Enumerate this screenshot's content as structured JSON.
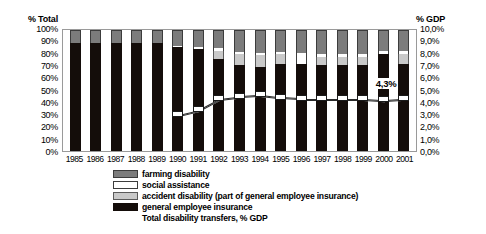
{
  "chart_data": {
    "type": "bar",
    "title": "",
    "subtitle": "",
    "stacked": true,
    "stack_mode": "percent",
    "grid": false,
    "legend_position": "bottom",
    "categories": [
      "1985",
      "1986",
      "1987",
      "1988",
      "1989",
      "1990",
      "1991",
      "1992",
      "1993",
      "1994",
      "1995",
      "1996",
      "1997",
      "1998",
      "1999",
      "2000",
      "2001"
    ],
    "xlabel": "",
    "ylabel": "% Total",
    "ylabel_secondary": "% GDP",
    "ylim": [
      0,
      100
    ],
    "ylim_secondary": [
      0,
      10
    ],
    "ytick_labels": [
      "100%",
      "90%",
      "80%",
      "70%",
      "60%",
      "50%",
      "40%",
      "30%",
      "20%",
      "10%",
      "0%"
    ],
    "ytick_values": [
      100,
      90,
      80,
      70,
      60,
      50,
      40,
      30,
      20,
      10,
      0
    ],
    "ytick_labels_secondary": [
      "10,0%",
      "9,0%",
      "8,0%",
      "7,0%",
      "6,0%",
      "5,0%",
      "4,0%",
      "3,0%",
      "2,0%",
      "1,0%",
      "0,0%"
    ],
    "ytick_values_secondary": [
      10,
      9,
      8,
      7,
      6,
      5,
      4,
      3,
      2,
      1,
      0
    ],
    "series": [
      {
        "name": "general employee insurance",
        "color": "#140d0a",
        "axis": "left",
        "values": [
          89,
          89,
          89,
          89,
          89,
          86,
          84,
          76,
          71,
          69,
          72,
          72,
          71,
          71,
          71,
          80,
          72
        ]
      },
      {
        "name": "accident disability (part of general employee insurance)",
        "color": "#c9c9c9",
        "axis": "left",
        "values": [
          0,
          0,
          0,
          0,
          0,
          0,
          0,
          7,
          9,
          10,
          8,
          0,
          7,
          7,
          7,
          0,
          8
        ]
      },
      {
        "name": "social assistance",
        "color": "#ffffff",
        "axis": "left",
        "values": [
          0,
          0,
          0,
          0,
          0,
          1,
          2,
          2,
          2,
          2,
          2,
          9,
          2,
          2,
          2,
          3,
          3
        ]
      },
      {
        "name": "farming disability",
        "color": "#7c7c7c",
        "axis": "left",
        "values": [
          11,
          11,
          11,
          11,
          11,
          13,
          14,
          15,
          18,
          19,
          18,
          19,
          20,
          20,
          20,
          17,
          17
        ]
      }
    ],
    "overlay_series": {
      "name": "Total disability transfers, % GDP",
      "axis": "right",
      "marker": "white-square",
      "values": [
        null,
        null,
        null,
        null,
        null,
        3.0,
        3.4,
        4.3,
        4.5,
        4.6,
        4.4,
        4.3,
        4.3,
        4.3,
        4.3,
        4.2,
        4.3
      ]
    },
    "data_labels": [
      {
        "category": "2001",
        "text": "4,3%"
      }
    ],
    "legend_entries": [
      "farming disability",
      "social assistance",
      "accident disability (part of general employee insurance)",
      "general employee insurance",
      "Total disability transfers, % GDP"
    ]
  },
  "colors": {
    "farming": "#7c7c7c",
    "social": "#ffffff",
    "accident": "#c9c9c9",
    "general": "#140d0a",
    "frame": "#9a9a9a",
    "text": "#000000"
  }
}
